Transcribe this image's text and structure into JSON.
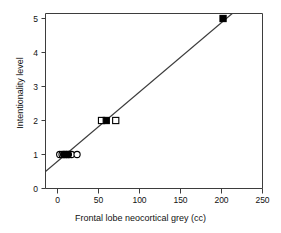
{
  "chart_data": {
    "type": "scatter",
    "title": "",
    "xlabel": "Frontal lobe neocortical grey (cc)",
    "ylabel": "Intentionality level",
    "xlim": [
      -15,
      260
    ],
    "ylim": [
      -0.25,
      5.35
    ],
    "xticks": [
      0,
      50,
      100,
      150,
      200,
      250
    ],
    "yticks": [
      0,
      1,
      2,
      3,
      4,
      5
    ],
    "xtick_labels": [
      "0",
      "50",
      "100",
      "150",
      "200",
      "250"
    ],
    "ytick_labels": [
      "0",
      "1",
      "2",
      "3",
      "4",
      "5"
    ],
    "grid": false,
    "legend": "none",
    "series": [
      {
        "name": "open circles",
        "marker": "open-circle",
        "color": "#000000",
        "points": [
          {
            "x": 3,
            "y": 1
          },
          {
            "x": 6,
            "y": 1
          },
          {
            "x": 9,
            "y": 1
          },
          {
            "x": 12,
            "y": 1
          },
          {
            "x": 15,
            "y": 1
          },
          {
            "x": 18,
            "y": 1
          },
          {
            "x": 25,
            "y": 1
          }
        ]
      },
      {
        "name": "filled circles",
        "marker": "filled-circle",
        "color": "#000000",
        "points": [
          {
            "x": 8,
            "y": 1
          },
          {
            "x": 11,
            "y": 1
          },
          {
            "x": 14,
            "y": 1
          }
        ]
      },
      {
        "name": "open squares",
        "marker": "open-square",
        "color": "#000000",
        "points": [
          {
            "x": 56,
            "y": 2
          },
          {
            "x": 74,
            "y": 2
          }
        ]
      },
      {
        "name": "filled squares",
        "marker": "filled-square",
        "color": "#000000",
        "points": [
          {
            "x": 62,
            "y": 2
          },
          {
            "x": 210,
            "y": 5
          }
        ]
      }
    ],
    "fit_line": {
      "name": "regression-line",
      "color": "#3b3b3b",
      "x_start": -15,
      "y_start": 0.5,
      "x_end": 232,
      "y_end": 5.35
    }
  },
  "axes": {
    "frame_color": "#3d3d3d",
    "tick_color": "#3d3d3d"
  }
}
